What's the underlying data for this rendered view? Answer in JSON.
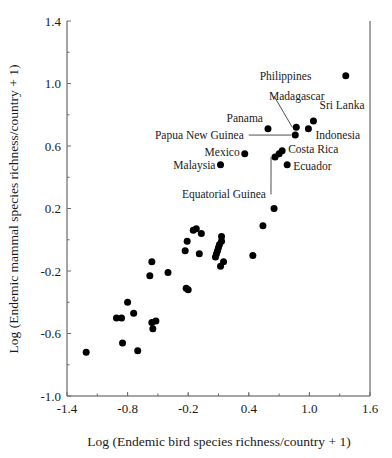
{
  "chart_data": {
    "type": "scatter",
    "title": "",
    "xlabel": "Log (Endemic bird species richness/country + 1)",
    "ylabel": "Log (Endemic mammal species richness/country + 1)",
    "xlim": [
      -1.4,
      1.6
    ],
    "ylim": [
      -1.0,
      1.4
    ],
    "xticks": [
      "-1.4",
      "-0.8",
      "-0.2",
      "0.4",
      "1.0",
      "1.6"
    ],
    "xtick_values": [
      -1.4,
      -0.8,
      -0.2,
      0.4,
      1.0,
      1.6
    ],
    "yticks": [
      "1.4",
      "1.0",
      "0.6",
      "0.2",
      "-0.2",
      "-0.6",
      "-1.0"
    ],
    "ytick_values": [
      1.4,
      1.0,
      0.6,
      0.2,
      -0.2,
      -0.6,
      -1.0
    ],
    "grid": false,
    "legend": null,
    "marker": "filled-circle",
    "marker_color": "#000000",
    "labeled_points": [
      {
        "name": "Philippines",
        "x": 1.36,
        "y": 1.05,
        "label_x": 1.02,
        "label_y": 1.05,
        "anchor": "end",
        "leader": false
      },
      {
        "name": "Madagascar",
        "x": 0.87,
        "y": 0.72,
        "label_x": 0.6,
        "label_y": 0.92,
        "anchor": "start",
        "leader": true
      },
      {
        "name": "Sri Lanka",
        "x": 1.04,
        "y": 0.76,
        "label_x": 1.1,
        "label_y": 0.86,
        "anchor": "start",
        "leader": false
      },
      {
        "name": "Panama",
        "x": 0.59,
        "y": 0.71,
        "label_x": 0.54,
        "label_y": 0.78,
        "anchor": "end",
        "leader": false
      },
      {
        "name": "Indonesia",
        "x": 0.99,
        "y": 0.71,
        "label_x": 1.06,
        "label_y": 0.67,
        "anchor": "start",
        "leader": false
      },
      {
        "name": "Papua New Guinea",
        "x": 0.86,
        "y": 0.67,
        "label_x": 0.35,
        "label_y": 0.67,
        "anchor": "end",
        "leader": true
      },
      {
        "name": "Mexico",
        "x": 0.36,
        "y": 0.55,
        "label_x": 0.31,
        "label_y": 0.56,
        "anchor": "end",
        "leader": false
      },
      {
        "name": "Costa Rica",
        "x": 0.73,
        "y": 0.57,
        "label_x": 0.79,
        "label_y": 0.58,
        "anchor": "start",
        "leader": false
      },
      {
        "name": "Malaysia",
        "x": 0.12,
        "y": 0.48,
        "label_x": 0.07,
        "label_y": 0.48,
        "anchor": "end",
        "leader": false
      },
      {
        "name": "Ecuador",
        "x": 0.78,
        "y": 0.48,
        "label_x": 0.84,
        "label_y": 0.47,
        "anchor": "start",
        "leader": false
      },
      {
        "name": "Equatorial Guinea",
        "x": 0.66,
        "y": 0.53,
        "label_x": 0.57,
        "label_y": 0.29,
        "anchor": "end",
        "leader": true
      }
    ],
    "unlabeled_points": [
      {
        "x": 0.7,
        "y": 0.55
      },
      {
        "x": 0.65,
        "y": 0.2
      },
      {
        "x": 0.54,
        "y": 0.09
      },
      {
        "x": 0.44,
        "y": -0.1
      },
      {
        "x": 0.13,
        "y": -0.01
      },
      {
        "x": 0.11,
        "y": -0.03
      },
      {
        "x": 0.1,
        "y": -0.05
      },
      {
        "x": 0.09,
        "y": -0.07
      },
      {
        "x": 0.08,
        "y": -0.09
      },
      {
        "x": 0.07,
        "y": -0.11
      },
      {
        "x": 0.13,
        "y": 0.02
      },
      {
        "x": 0.15,
        "y": -0.14
      },
      {
        "x": 0.12,
        "y": -0.17
      },
      {
        "x": -0.09,
        "y": -0.09
      },
      {
        "x": -0.07,
        "y": 0.04
      },
      {
        "x": -0.15,
        "y": 0.06
      },
      {
        "x": -0.12,
        "y": 0.07
      },
      {
        "x": -0.21,
        "y": -0.01
      },
      {
        "x": -0.23,
        "y": -0.07
      },
      {
        "x": -0.22,
        "y": -0.31
      },
      {
        "x": -0.2,
        "y": -0.32
      },
      {
        "x": -0.4,
        "y": -0.21
      },
      {
        "x": -0.56,
        "y": -0.14
      },
      {
        "x": -0.58,
        "y": -0.23
      },
      {
        "x": -0.56,
        "y": -0.53
      },
      {
        "x": -0.55,
        "y": -0.57
      },
      {
        "x": -0.52,
        "y": -0.52
      },
      {
        "x": -0.7,
        "y": -0.71
      },
      {
        "x": -0.74,
        "y": -0.47
      },
      {
        "x": -0.85,
        "y": -0.66
      },
      {
        "x": -0.86,
        "y": -0.5
      },
      {
        "x": -0.8,
        "y": -0.4
      },
      {
        "x": -0.91,
        "y": -0.5
      },
      {
        "x": -1.21,
        "y": -0.72
      }
    ]
  }
}
